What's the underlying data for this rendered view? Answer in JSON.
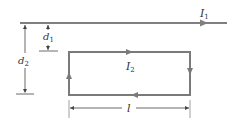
{
  "diagram": {
    "type": "physics-figure",
    "colors": {
      "wire": "#808080",
      "loop": "#7a7a7a",
      "dimension": "#444444",
      "text": "#333333"
    },
    "wire": {
      "label_main": "I",
      "label_sub": "1",
      "direction": "right"
    },
    "loop": {
      "label_main": "I",
      "label_sub": "2",
      "direction": "clockwise"
    },
    "dimensions": {
      "d1": {
        "label_main": "d",
        "label_sub": "1"
      },
      "d2": {
        "label_main": "d",
        "label_sub": "2"
      },
      "l": {
        "label": "l"
      }
    }
  }
}
